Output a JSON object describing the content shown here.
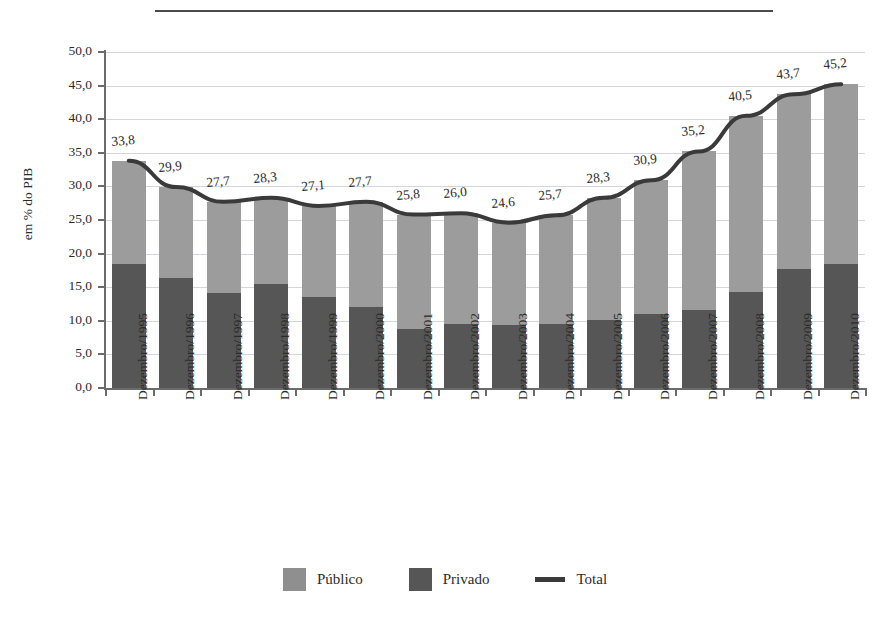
{
  "title": {
    "text": "",
    "note": "title cropped above top edge; only the horizontal rule is visible"
  },
  "legend": {
    "position": "bottom-center",
    "items": [
      {
        "label": "Público",
        "marker": "square",
        "color": "#8f8f8f"
      },
      {
        "label": "Privado",
        "marker": "square",
        "color": "#565656"
      },
      {
        "label": "Total",
        "marker": "line",
        "color": "#3a3a3a"
      }
    ]
  },
  "axes": {
    "ylabel": "em % do PIB",
    "xlabel": "",
    "yticks": [
      "50,0",
      "45,0",
      "40,0",
      "35,0",
      "30,0",
      "25,0",
      "20,0",
      "15,0",
      "10,0",
      "5,0",
      "0,0"
    ],
    "ylim": [
      0,
      50
    ],
    "grid": true
  },
  "chart_data": {
    "type": "bar",
    "title": "",
    "xlabel": "",
    "ylabel": "em % do PIB",
    "ylim": [
      0,
      50
    ],
    "ytick_step": 5,
    "grid": true,
    "legend_position": "bottom",
    "stacked": true,
    "categories": [
      "Dezembro/1995",
      "Dezembro/1996",
      "Dezembro/1997",
      "Dezembro/1998",
      "Dezembro/1999",
      "Dezembro/2000",
      "Dezembro/2001",
      "Dezembro/2002",
      "Dezembro/2003",
      "Dezembro/2004",
      "Dezembro/2005",
      "Dezembro/2006",
      "Dezembro/2007",
      "Dezembro/2008",
      "Dezembro/2009",
      "Dezembro/2010"
    ],
    "series": [
      {
        "name": "Privado",
        "kind": "bar",
        "color": "#565656",
        "values": [
          18.5,
          16.3,
          14.2,
          15.5,
          13.5,
          12.0,
          8.8,
          9.5,
          9.4,
          9.5,
          10.1,
          11.0,
          11.6,
          14.3,
          17.7,
          18.5
        ]
      },
      {
        "name": "Público",
        "kind": "bar",
        "color": "#9c9c9c",
        "values": [
          15.3,
          13.6,
          13.5,
          12.8,
          13.6,
          15.7,
          17.0,
          16.5,
          15.2,
          16.2,
          18.2,
          19.9,
          23.6,
          26.2,
          26.0,
          26.7
        ]
      },
      {
        "name": "Total",
        "kind": "line",
        "color": "#3a3a3a",
        "values": [
          33.8,
          29.9,
          27.7,
          28.3,
          27.1,
          27.7,
          25.8,
          26.0,
          24.6,
          25.7,
          28.3,
          30.9,
          35.2,
          40.5,
          43.7,
          45.2
        ],
        "data_labels": [
          "33,8",
          "29,9",
          "27,7",
          "28,3",
          "27,1",
          "27,7",
          "25,8",
          "26,0",
          "24,6",
          "25,7",
          "28,3",
          "30,9",
          "35,2",
          "40,5",
          "43,7",
          "45,2"
        ]
      }
    ]
  }
}
